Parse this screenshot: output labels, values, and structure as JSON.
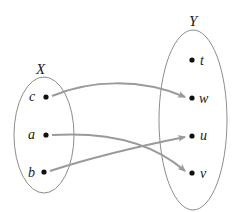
{
  "diagram": {
    "type": "function-mapping",
    "sets": {
      "domain": {
        "label": "X",
        "elements": [
          "c",
          "a",
          "b"
        ]
      },
      "codomain": {
        "label": "Y",
        "elements": [
          "t",
          "w",
          "u",
          "v"
        ]
      }
    },
    "mappings": [
      {
        "from": "c",
        "to": "w"
      },
      {
        "from": "a",
        "to": "v"
      },
      {
        "from": "b",
        "to": "u"
      }
    ],
    "colors": {
      "ellipse_stroke": "#8c8c8c",
      "arrow": "#9a9a9a",
      "dot": "#111111",
      "text": "#1a1a1a"
    }
  }
}
